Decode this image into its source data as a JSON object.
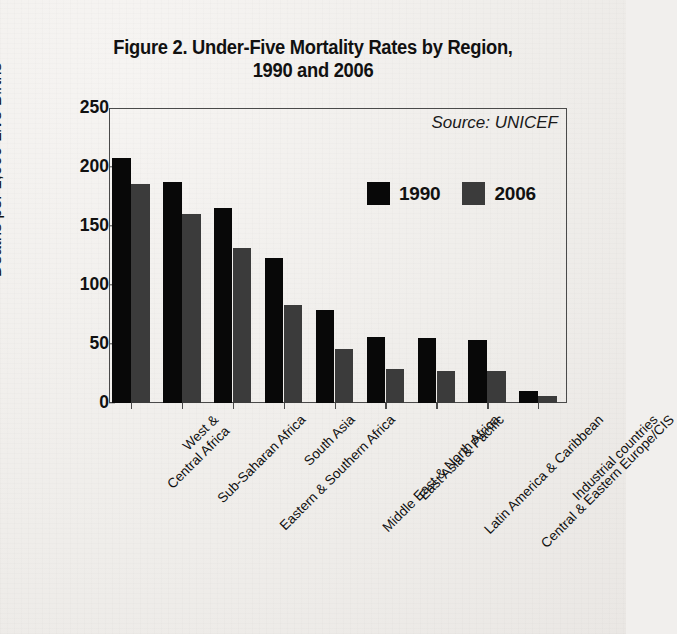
{
  "chart_data": {
    "type": "bar",
    "title": "Figure 2. Under-Five Mortality Rates by Region, 1990 and 2006",
    "title_line1": "Figure 2. Under-Five Mortality Rates by Region,",
    "title_line2": "1990 and 2006",
    "xlabel": "",
    "ylabel": "Deaths per 1,000 Live Births",
    "ylim": [
      0,
      250
    ],
    "yticks": [
      0,
      50,
      100,
      150,
      200,
      250
    ],
    "ytick_labels": [
      "0",
      "50",
      "100",
      "150",
      "200",
      "250"
    ],
    "grid": false,
    "legend_position": "upper-center-right",
    "annotation": "Source: UNICEF",
    "categories": [
      "West & Central Africa",
      "Sub-Saharan Africa",
      "Eastern & Southern Africa",
      "South Asia",
      "Middle East & North Africa",
      "East Asia & Pacific",
      "Latin America & Caribbean",
      "Central & Eastern Europe/CIS",
      "Industrial countries"
    ],
    "category_label_lines": [
      [
        "West &",
        "Central Africa"
      ],
      [
        "Sub-Saharan Africa",
        ""
      ],
      [
        "Eastern & Southern Africa",
        ""
      ],
      [
        "South Asia",
        ""
      ],
      [
        "Middle East & North Africa",
        ""
      ],
      [
        "East Asia & Pacific",
        ""
      ],
      [
        "Latin America & Caribbean",
        ""
      ],
      [
        "Central & Eastern Europe/CIS",
        ""
      ],
      [
        "Industrial countries",
        ""
      ]
    ],
    "series": [
      {
        "name": "1990",
        "color": "#080808",
        "values": [
          208,
          187,
          165,
          123,
          79,
          56,
          55,
          53,
          10
        ]
      },
      {
        "name": "2006",
        "color": "#3b3b3b",
        "values": [
          186,
          160,
          131,
          83,
          46,
          29,
          27,
          27,
          6
        ]
      }
    ]
  },
  "legend": {
    "entries": [
      {
        "label": "1990",
        "color": "#080808"
      },
      {
        "label": "2006",
        "color": "#3b3b3b"
      }
    ]
  },
  "colors": {
    "series_1990": "#080808",
    "series_2006": "#3b3b3b",
    "axis": "#4a4a4a",
    "text": "#111111",
    "background": "#f1efed"
  }
}
